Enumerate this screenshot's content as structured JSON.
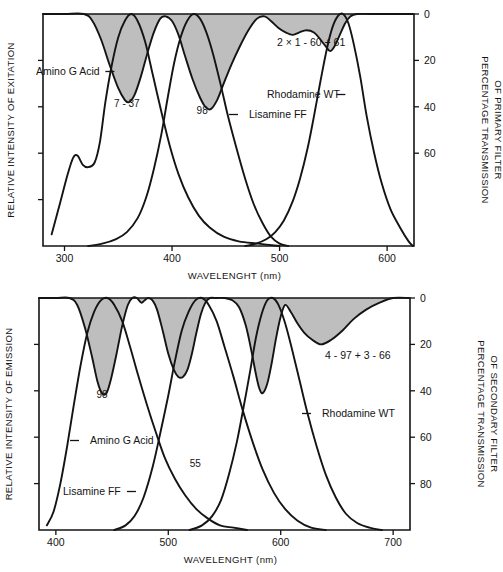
{
  "figure": {
    "background_color": "#ffffff",
    "line_color": "#141414",
    "band_color": "#b9b9b9"
  },
  "chart_data": [
    {
      "id": "excitation",
      "type": "line",
      "title": "",
      "xlabel": "WAVELENGHT (nm)",
      "ylabel": "RELATIVE INTENSITY OF EXITATION",
      "y2label_line1": "PERCENTAGE TRANSMISSION",
      "y2label_line2": "OF PRIMARY FILTER",
      "xlim": [
        280,
        625
      ],
      "xticks": [
        300,
        400,
        500,
        600
      ],
      "xticklabels": [
        "300",
        "400",
        "500",
        "600"
      ],
      "ylim": [
        0,
        100
      ],
      "y2ticks": [
        0,
        20,
        40,
        60
      ],
      "y2ticklabels": [
        "0",
        "20",
        "40",
        "60"
      ],
      "grid": false,
      "legend": "inline-annotations",
      "filter_label": "2 × 1 - 60 + 61",
      "annotations": [
        {
          "text": "7 - 37",
          "x": 358,
          "y_pct": 60
        },
        {
          "text": "98",
          "x": 428,
          "y_pct": 57
        }
      ],
      "series": [
        {
          "name": "Amino G Acid",
          "label": "Amino G Acid",
          "label_side": "right-dash",
          "points": [
            [
              288,
              5
            ],
            [
              295,
              17
            ],
            [
              303,
              31
            ],
            [
              308,
              38
            ],
            [
              312,
              39
            ],
            [
              317,
              35
            ],
            [
              322,
              34
            ],
            [
              328,
              36
            ],
            [
              333,
              45
            ],
            [
              338,
              62
            ],
            [
              344,
              78
            ],
            [
              350,
              90
            ],
            [
              356,
              97
            ],
            [
              362,
              100
            ],
            [
              368,
              97
            ],
            [
              375,
              88
            ],
            [
              382,
              74
            ],
            [
              390,
              58
            ],
            [
              398,
              43
            ],
            [
              406,
              31
            ],
            [
              415,
              21
            ],
            [
              425,
              13
            ],
            [
              435,
              8
            ],
            [
              448,
              4
            ],
            [
              462,
              2
            ],
            [
              480,
              1
            ],
            [
              500,
              0
            ]
          ]
        },
        {
          "name": "Lisamine FF",
          "label": "Lisamine FF",
          "label_side": "left-dash",
          "points": [
            [
              322,
              0
            ],
            [
              335,
              1
            ],
            [
              348,
              3
            ],
            [
              358,
              6
            ],
            [
              368,
              12
            ],
            [
              376,
              21
            ],
            [
              383,
              33
            ],
            [
              390,
              48
            ],
            [
              396,
              64
            ],
            [
              402,
              79
            ],
            [
              408,
              90
            ],
            [
              414,
              97
            ],
            [
              420,
              100
            ],
            [
              426,
              98
            ],
            [
              432,
              92
            ],
            [
              438,
              83
            ],
            [
              445,
              70
            ],
            [
              452,
              56
            ],
            [
              460,
              42
            ],
            [
              468,
              29
            ],
            [
              476,
              18
            ],
            [
              484,
              10
            ],
            [
              492,
              4
            ],
            [
              500,
              1
            ],
            [
              508,
              0
            ]
          ]
        },
        {
          "name": "Rhodamine WT",
          "label": "Rhodamine WT",
          "label_side": "right-dash",
          "points": [
            [
              468,
              0
            ],
            [
              478,
              1
            ],
            [
              488,
              3
            ],
            [
              496,
              6
            ],
            [
              504,
              11
            ],
            [
              512,
              19
            ],
            [
              519,
              29
            ],
            [
              526,
              42
            ],
            [
              532,
              56
            ],
            [
              538,
              71
            ],
            [
              544,
              85
            ],
            [
              549,
              94
            ],
            [
              554,
              99
            ],
            [
              559,
              100
            ],
            [
              564,
              96
            ],
            [
              569,
              87
            ],
            [
              575,
              73
            ],
            [
              581,
              56
            ],
            [
              588,
              40
            ],
            [
              595,
              27
            ],
            [
              603,
              16
            ],
            [
              612,
              8
            ],
            [
              620,
              2
            ],
            [
              624,
              0
            ]
          ]
        },
        {
          "name": "Primary filter transmission",
          "label": "2 × 1 - 60 + 61",
          "label_side": "inline",
          "is_filter": true,
          "points_transmission": [
            [
              280,
              0
            ],
            [
              300,
              0
            ],
            [
              318,
              0
            ],
            [
              326,
              3
            ],
            [
              334,
              11
            ],
            [
              342,
              22
            ],
            [
              350,
              32
            ],
            [
              356,
              37
            ],
            [
              360,
              38
            ],
            [
              365,
              35
            ],
            [
              371,
              27
            ],
            [
              377,
              17
            ],
            [
              383,
              8
            ],
            [
              389,
              2
            ],
            [
              394,
              1
            ],
            [
              400,
              3
            ],
            [
              406,
              9
            ],
            [
              412,
              18
            ],
            [
              419,
              28
            ],
            [
              426,
              36
            ],
            [
              431,
              40
            ],
            [
              436,
              41
            ],
            [
              442,
              37
            ],
            [
              448,
              30
            ],
            [
              455,
              22
            ],
            [
              463,
              14
            ],
            [
              471,
              7
            ],
            [
              479,
              2
            ],
            [
              486,
              1
            ],
            [
              492,
              3
            ],
            [
              499,
              6
            ],
            [
              506,
              8
            ],
            [
              512,
              9
            ],
            [
              518,
              8
            ],
            [
              525,
              7
            ],
            [
              532,
              8
            ],
            [
              538,
              11
            ],
            [
              543,
              14
            ],
            [
              547,
              16
            ],
            [
              551,
              14
            ],
            [
              556,
              9
            ],
            [
              561,
              4
            ],
            [
              566,
              1
            ],
            [
              572,
              0
            ],
            [
              585,
              0
            ],
            [
              610,
              0
            ],
            [
              624,
              0
            ]
          ]
        }
      ]
    },
    {
      "id": "emission",
      "type": "line",
      "title": "",
      "xlabel": "WAVELENGHT (nm)",
      "ylabel": "RELATIVE INTENSITY OF EMISSION",
      "y2label_line1": "PERCENTAGE TRANSMISSION",
      "y2label_line2": "OF SECONDARY FILTER",
      "xlim": [
        385,
        715
      ],
      "xticks": [
        400,
        500,
        600,
        700
      ],
      "xticklabels": [
        "400",
        "500",
        "600",
        "700"
      ],
      "ylim": [
        0,
        100
      ],
      "y2ticks": [
        0,
        20,
        40,
        60,
        80
      ],
      "y2ticklabels": [
        "0",
        "20",
        "40",
        "60",
        "80"
      ],
      "grid": false,
      "legend": "inline-annotations",
      "filter_label": "4 - 97 + 3 - 66",
      "annotations": [
        {
          "text": "98",
          "x": 441,
          "y_pct": 57
        },
        {
          "text": "55",
          "x": 524,
          "y_pct": 27
        }
      ],
      "series": [
        {
          "name": "Amino G Acid",
          "label": "Amino G Acid",
          "label_side": "left-dash",
          "points": [
            [
              392,
              2
            ],
            [
              398,
              8
            ],
            [
              404,
              20
            ],
            [
              410,
              36
            ],
            [
              416,
              54
            ],
            [
              422,
              71
            ],
            [
              428,
              85
            ],
            [
              434,
              94
            ],
            [
              440,
              99
            ],
            [
              446,
              100
            ],
            [
              452,
              97
            ],
            [
              459,
              90
            ],
            [
              466,
              79
            ],
            [
              473,
              67
            ],
            [
              481,
              54
            ],
            [
              489,
              42
            ],
            [
              497,
              31
            ],
            [
              506,
              22
            ],
            [
              515,
              15
            ],
            [
              525,
              9
            ],
            [
              535,
              5
            ],
            [
              546,
              2
            ],
            [
              558,
              1
            ],
            [
              570,
              0
            ]
          ]
        },
        {
          "name": "Lisamine FF",
          "label": "Lisamine FF",
          "label_side": "right-dash",
          "points": [
            [
              452,
              0
            ],
            [
              462,
              2
            ],
            [
              470,
              6
            ],
            [
              478,
              14
            ],
            [
              486,
              27
            ],
            [
              493,
              42
            ],
            [
              500,
              58
            ],
            [
              506,
              73
            ],
            [
              512,
              86
            ],
            [
              518,
              94
            ],
            [
              524,
              99
            ],
            [
              530,
              100
            ],
            [
              536,
              97
            ],
            [
              543,
              90
            ],
            [
              550,
              79
            ],
            [
              558,
              66
            ],
            [
              566,
              52
            ],
            [
              575,
              38
            ],
            [
              584,
              26
            ],
            [
              594,
              16
            ],
            [
              604,
              9
            ],
            [
              615,
              4
            ],
            [
              627,
              1
            ],
            [
              640,
              0
            ]
          ]
        },
        {
          "name": "Rhodamine WT",
          "label": "Rhodamine WT",
          "label_side": "left-dash",
          "points": [
            [
              519,
              0
            ],
            [
              530,
              2
            ],
            [
              539,
              6
            ],
            [
              547,
              13
            ],
            [
              554,
              24
            ],
            [
              561,
              38
            ],
            [
              567,
              53
            ],
            [
              573,
              69
            ],
            [
              578,
              83
            ],
            [
              583,
              93
            ],
            [
              588,
              99
            ],
            [
              593,
              100
            ],
            [
              598,
              97
            ],
            [
              604,
              89
            ],
            [
              610,
              78
            ],
            [
              617,
              64
            ],
            [
              624,
              50
            ],
            [
              632,
              36
            ],
            [
              640,
              24
            ],
            [
              649,
              14
            ],
            [
              658,
              7
            ],
            [
              668,
              3
            ],
            [
              679,
              1
            ],
            [
              690,
              0
            ]
          ]
        },
        {
          "name": "Secondary filter transmission",
          "label": "4 - 97 + 3 - 66",
          "label_side": "inline",
          "is_filter": true,
          "points_transmission": [
            [
              385,
              0
            ],
            [
              400,
              0
            ],
            [
              412,
              0
            ],
            [
              419,
              3
            ],
            [
              426,
              13
            ],
            [
              432,
              25
            ],
            [
              437,
              36
            ],
            [
              441,
              41
            ],
            [
              445,
              41
            ],
            [
              449,
              35
            ],
            [
              454,
              24
            ],
            [
              459,
              12
            ],
            [
              464,
              3
            ],
            [
              468,
              0
            ],
            [
              472,
              0
            ],
            [
              476,
              2
            ],
            [
              479,
              1
            ],
            [
              482,
              0
            ],
            [
              486,
              1
            ],
            [
              490,
              5
            ],
            [
              495,
              14
            ],
            [
              500,
              24
            ],
            [
              505,
              31
            ],
            [
              509,
              34
            ],
            [
              513,
              34
            ],
            [
              517,
              31
            ],
            [
              521,
              24
            ],
            [
              525,
              15
            ],
            [
              529,
              7
            ],
            [
              533,
              2
            ],
            [
              537,
              0
            ],
            [
              543,
              0
            ],
            [
              550,
              0
            ],
            [
              557,
              1
            ],
            [
              563,
              4
            ],
            [
              569,
              12
            ],
            [
              574,
              23
            ],
            [
              578,
              33
            ],
            [
              581,
              39
            ],
            [
              584,
              41
            ],
            [
              588,
              37
            ],
            [
              592,
              28
            ],
            [
              596,
              17
            ],
            [
              600,
              8
            ],
            [
              604,
              3
            ],
            [
              609,
              6
            ],
            [
              615,
              11
            ],
            [
              621,
              15
            ],
            [
              628,
              18
            ],
            [
              636,
              20
            ],
            [
              645,
              18
            ],
            [
              655,
              14
            ],
            [
              665,
              9
            ],
            [
              676,
              5
            ],
            [
              688,
              2
            ],
            [
              700,
              0
            ],
            [
              714,
              0
            ]
          ]
        }
      ]
    }
  ]
}
